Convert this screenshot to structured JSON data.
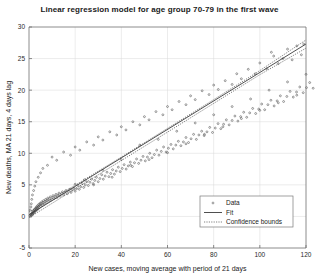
{
  "chart_data": {
    "type": "scatter",
    "title": "Linear regression model for age group 70-79 in the first wave",
    "xlabel": "New cases, moving average with period of 21 days",
    "ylabel": "New deaths, MA 21 days, 4 days lag",
    "xlim": [
      0,
      120
    ],
    "ylim": [
      -5,
      30
    ],
    "xticks": [
      0,
      20,
      40,
      60,
      80,
      100,
      120
    ],
    "yticks": [
      -5,
      0,
      5,
      10,
      15,
      20,
      25,
      30
    ],
    "grid": true,
    "legend_position": "lower right",
    "legend": [
      {
        "label": "Data",
        "marker": "point",
        "style": "scatter"
      },
      {
        "label": "Fit",
        "marker": "line",
        "style": "solid"
      },
      {
        "label": "Confidence bounds",
        "marker": "line",
        "style": "dotted"
      }
    ],
    "series": [
      {
        "name": "Fit",
        "type": "line",
        "slope": 0.2255,
        "intercept": 0.25,
        "x": [
          0,
          120
        ],
        "y": [
          0.25,
          27.31
        ]
      },
      {
        "name": "Confidence bounds upper",
        "type": "line",
        "style": "dotted",
        "x": [
          0,
          20,
          40,
          60,
          80,
          100,
          120
        ],
        "y": [
          0.7,
          4.95,
          9.4,
          13.95,
          18.5,
          23.1,
          27.95
        ]
      },
      {
        "name": "Confidence bounds lower",
        "type": "line",
        "style": "dotted",
        "x": [
          0,
          20,
          40,
          60,
          80,
          100,
          120
        ],
        "y": [
          -0.2,
          4.35,
          8.85,
          13.35,
          17.9,
          22.45,
          26.65
        ]
      },
      {
        "name": "Data",
        "type": "scatter",
        "points": [
          [
            0.4,
            0.1
          ],
          [
            0.6,
            0.3
          ],
          [
            0.8,
            0.0
          ],
          [
            1.0,
            0.4
          ],
          [
            1.1,
            0.2
          ],
          [
            1.3,
            0.5
          ],
          [
            1.4,
            0.3
          ],
          [
            1.5,
            0.7
          ],
          [
            1.6,
            0.4
          ],
          [
            1.8,
            0.6
          ],
          [
            1.9,
            0.9
          ],
          [
            2.0,
            0.5
          ],
          [
            2.2,
            0.8
          ],
          [
            2.3,
            1.1
          ],
          [
            2.5,
            0.7
          ],
          [
            2.6,
            1.0
          ],
          [
            2.8,
            1.3
          ],
          [
            2.9,
            0.9
          ],
          [
            3.1,
            1.2
          ],
          [
            3.2,
            1.5
          ],
          [
            3.4,
            1.0
          ],
          [
            3.5,
            1.4
          ],
          [
            3.7,
            1.7
          ],
          [
            3.9,
            1.2
          ],
          [
            4.0,
            1.6
          ],
          [
            4.2,
            1.9
          ],
          [
            4.4,
            1.4
          ],
          [
            4.6,
            1.8
          ],
          [
            4.8,
            2.1
          ],
          [
            5.0,
            1.6
          ],
          [
            5.2,
            2.0
          ],
          [
            5.5,
            2.3
          ],
          [
            5.8,
            1.8
          ],
          [
            6.0,
            2.2
          ],
          [
            6.3,
            2.5
          ],
          [
            6.6,
            2.0
          ],
          [
            6.9,
            2.4
          ],
          [
            7.2,
            2.7
          ],
          [
            7.5,
            2.2
          ],
          [
            7.8,
            2.6
          ],
          [
            8.1,
            2.9
          ],
          [
            8.5,
            2.4
          ],
          [
            8.8,
            2.8
          ],
          [
            9.2,
            3.1
          ],
          [
            9.6,
            2.6
          ],
          [
            10.0,
            3.0
          ],
          [
            10.4,
            3.3
          ],
          [
            10.8,
            2.8
          ],
          [
            11.2,
            3.2
          ],
          [
            11.7,
            3.5
          ],
          [
            12.1,
            3.0
          ],
          [
            12.6,
            3.4
          ],
          [
            13.0,
            3.7
          ],
          [
            13.5,
            3.2
          ],
          [
            14.0,
            3.6
          ],
          [
            14.5,
            3.9
          ],
          [
            15.0,
            3.4
          ],
          [
            15.5,
            3.8
          ],
          [
            16.0,
            4.1
          ],
          [
            16.6,
            3.6
          ],
          [
            17.1,
            4.0
          ],
          [
            17.7,
            4.3
          ],
          [
            18.2,
            3.8
          ],
          [
            18.8,
            4.2
          ],
          [
            19.4,
            4.5
          ],
          [
            20.0,
            4.0
          ],
          [
            20.6,
            4.4
          ],
          [
            21.2,
            4.9
          ],
          [
            21.8,
            4.3
          ],
          [
            22.4,
            4.7
          ],
          [
            23.1,
            5.2
          ],
          [
            23.7,
            4.6
          ],
          [
            24.4,
            5.0
          ],
          [
            25.0,
            5.5
          ],
          [
            25.7,
            4.9
          ],
          [
            26.4,
            5.4
          ],
          [
            27.1,
            5.9
          ],
          [
            27.8,
            5.2
          ],
          [
            28.5,
            5.7
          ],
          [
            29.2,
            6.2
          ],
          [
            30.0,
            5.5
          ],
          [
            30.7,
            6.0
          ],
          [
            31.5,
            6.6
          ],
          [
            32.2,
            5.9
          ],
          [
            33.0,
            6.4
          ],
          [
            33.8,
            7.0
          ],
          [
            34.6,
            6.3
          ],
          [
            35.4,
            6.8
          ],
          [
            36.2,
            7.4
          ],
          [
            37.0,
            6.7
          ],
          [
            37.8,
            7.2
          ],
          [
            38.7,
            7.8
          ],
          [
            39.5,
            7.1
          ],
          [
            40.4,
            7.6
          ],
          [
            41.2,
            8.2
          ],
          [
            42.1,
            7.5
          ],
          [
            43.0,
            8.0
          ],
          [
            43.9,
            8.6
          ],
          [
            44.8,
            7.9
          ],
          [
            45.7,
            8.5
          ],
          [
            46.6,
            9.1
          ],
          [
            47.5,
            8.4
          ],
          [
            48.5,
            8.9
          ],
          [
            49.4,
            9.5
          ],
          [
            50.4,
            8.8
          ],
          [
            51.3,
            9.4
          ],
          [
            52.3,
            10.0
          ],
          [
            53.3,
            9.3
          ],
          [
            54.3,
            9.8
          ],
          [
            55.3,
            10.5
          ],
          [
            56.3,
            9.7
          ],
          [
            57.3,
            10.3
          ],
          [
            58.3,
            11.0
          ],
          [
            59.4,
            10.2
          ],
          [
            60.4,
            10.8
          ],
          [
            61.5,
            11.4
          ],
          [
            62.5,
            10.7
          ],
          [
            63.6,
            11.3
          ],
          [
            64.7,
            11.9
          ],
          [
            65.8,
            11.2
          ],
          [
            66.9,
            11.8
          ],
          [
            68.0,
            12.5
          ],
          [
            69.1,
            11.7
          ],
          [
            70.2,
            12.3
          ],
          [
            71.3,
            13.0
          ],
          [
            72.5,
            12.2
          ],
          [
            73.6,
            12.9
          ],
          [
            74.8,
            13.5
          ],
          [
            75.9,
            12.8
          ],
          [
            77.1,
            13.4
          ],
          [
            78.3,
            14.1
          ],
          [
            79.5,
            13.3
          ],
          [
            80.7,
            14.0
          ],
          [
            81.9,
            14.7
          ],
          [
            83.1,
            13.9
          ],
          [
            84.3,
            14.6
          ],
          [
            85.5,
            15.3
          ],
          [
            86.7,
            14.5
          ],
          [
            88.0,
            15.2
          ],
          [
            89.2,
            15.9
          ],
          [
            90.5,
            15.1
          ],
          [
            91.7,
            15.8
          ],
          [
            93.0,
            16.5
          ],
          [
            94.3,
            15.7
          ],
          [
            95.6,
            16.4
          ],
          [
            96.9,
            17.1
          ],
          [
            98.2,
            16.3
          ],
          [
            99.5,
            17.0
          ],
          [
            100.8,
            17.8
          ],
          [
            102.1,
            16.9
          ],
          [
            103.5,
            17.7
          ],
          [
            104.8,
            18.4
          ],
          [
            106.2,
            17.5
          ],
          [
            107.5,
            18.3
          ],
          [
            108.9,
            19.1
          ],
          [
            110.3,
            18.2
          ],
          [
            111.7,
            19.0
          ],
          [
            113.1,
            19.8
          ],
          [
            114.5,
            18.9
          ],
          [
            115.9,
            19.7
          ],
          [
            117.3,
            20.5
          ],
          [
            118.8,
            19.6
          ],
          [
            120.2,
            20.4
          ],
          [
            121.6,
            21.2
          ],
          [
            123.1,
            20.3
          ],
          [
            20.0,
            5.1
          ],
          [
            24.0,
            5.8
          ],
          [
            28.0,
            5.0
          ],
          [
            32.0,
            7.3
          ],
          [
            36.0,
            6.2
          ],
          [
            40.0,
            9.0
          ],
          [
            44.0,
            8.1
          ],
          [
            48.0,
            11.3
          ],
          [
            52.0,
            9.0
          ],
          [
            56.0,
            12.2
          ],
          [
            60.0,
            10.1
          ],
          [
            64.0,
            13.5
          ],
          [
            68.0,
            11.5
          ],
          [
            72.0,
            14.8
          ],
          [
            76.0,
            13.0
          ],
          [
            80.0,
            16.1
          ],
          [
            84.0,
            14.2
          ],
          [
            88.0,
            17.4
          ],
          [
            92.0,
            15.5
          ],
          [
            96.0,
            18.6
          ],
          [
            100.0,
            16.8
          ],
          [
            104.0,
            20.0
          ],
          [
            108.0,
            18.0
          ],
          [
            112.0,
            21.3
          ],
          [
            116.0,
            19.2
          ],
          [
            120.0,
            22.5
          ],
          [
            105.0,
            26.0
          ],
          [
            110.0,
            25.0
          ],
          [
            112.0,
            26.5
          ],
          [
            114.0,
            24.8
          ],
          [
            116.0,
            27.0
          ],
          [
            118.0,
            25.6
          ],
          [
            119.0,
            27.3
          ],
          [
            108.0,
            24.2
          ],
          [
            106.0,
            25.4
          ],
          [
            103.0,
            23.4
          ],
          [
            100.0,
            24.3
          ],
          [
            98.0,
            22.6
          ],
          [
            95.0,
            23.3
          ],
          [
            92.0,
            21.8
          ],
          [
            90.0,
            22.6
          ],
          [
            88.0,
            20.9
          ],
          [
            85.0,
            21.5
          ],
          [
            82.0,
            20.1
          ],
          [
            80.0,
            20.8
          ],
          [
            78.0,
            19.3
          ],
          [
            75.0,
            19.9
          ],
          [
            72.0,
            18.5
          ],
          [
            70.0,
            19.1
          ],
          [
            68.0,
            17.7
          ],
          [
            65.0,
            18.2
          ],
          [
            62.0,
            16.9
          ],
          [
            60.0,
            17.4
          ],
          [
            58.0,
            16.1
          ],
          [
            55.0,
            16.6
          ],
          [
            52.0,
            15.3
          ],
          [
            50.0,
            15.8
          ],
          [
            48.0,
            14.5
          ],
          [
            45.0,
            15.0
          ],
          [
            42.0,
            13.7
          ],
          [
            40.0,
            14.2
          ],
          [
            38.0,
            12.9
          ],
          [
            35.0,
            13.4
          ],
          [
            32.0,
            12.1
          ],
          [
            30.0,
            12.6
          ],
          [
            28.0,
            11.3
          ],
          [
            25.0,
            11.8
          ],
          [
            22.0,
            10.5
          ],
          [
            20.0,
            11.0
          ],
          [
            18.0,
            9.7
          ],
          [
            15.0,
            10.2
          ],
          [
            12.0,
            8.9
          ],
          [
            10.0,
            9.4
          ],
          [
            8.0,
            8.1
          ],
          [
            6.0,
            7.6
          ],
          [
            5.0,
            6.9
          ],
          [
            4.0,
            6.2
          ],
          [
            3.0,
            5.5
          ],
          [
            2.5,
            4.8
          ],
          [
            2.0,
            4.1
          ],
          [
            1.5,
            3.4
          ],
          [
            1.2,
            2.7
          ],
          [
            1.0,
            2.0
          ],
          [
            0.8,
            1.5
          ],
          [
            0.5,
            1.0
          ]
        ]
      }
    ]
  }
}
